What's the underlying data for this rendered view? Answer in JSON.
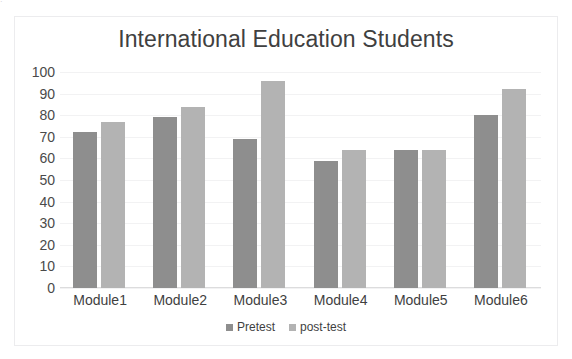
{
  "scan": {
    "top_sliver_text": "."
  },
  "chart_data": {
    "type": "bar",
    "title": "International Education Students",
    "xlabel": "",
    "ylabel": "",
    "ylim": [
      0,
      100
    ],
    "ytick_step": 10,
    "ytick_labels": [
      "100",
      "90",
      "80",
      "70",
      "60",
      "50",
      "40",
      "30",
      "20",
      "10",
      "0"
    ],
    "grid": true,
    "grid_axis": "y",
    "legend_position": "bottom",
    "categories": [
      "Module1",
      "Module2",
      "Module3",
      "Module4",
      "Module5",
      "Module6"
    ],
    "series": [
      {
        "name": "Pretest",
        "color": "#8e8e8e",
        "values": [
          72,
          79,
          69,
          59,
          64,
          80
        ]
      },
      {
        "name": "post-test",
        "color": "#b3b3b3",
        "values": [
          77,
          84,
          96,
          64,
          64,
          92
        ]
      }
    ]
  }
}
